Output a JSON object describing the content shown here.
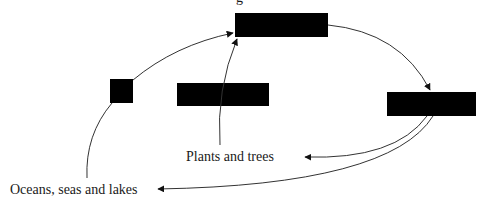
{
  "diagram": {
    "type": "water-cycle-flow",
    "top_label_fragment": "g",
    "boxes": [
      {
        "id": "top",
        "label": "",
        "redacted": true
      },
      {
        "id": "left-small",
        "label": "",
        "redacted": true
      },
      {
        "id": "middle",
        "label": "",
        "redacted": true
      },
      {
        "id": "right",
        "label": "",
        "redacted": true
      }
    ],
    "labels": {
      "plants": "Plants and trees",
      "oceans": "Oceans, seas and lakes"
    },
    "edges": [
      {
        "from": "left-small",
        "to": "top"
      },
      {
        "from": "plants",
        "to": "top"
      },
      {
        "from": "top",
        "to": "right"
      },
      {
        "from": "right",
        "to": "plants"
      },
      {
        "from": "right",
        "to": "oceans"
      },
      {
        "from": "oceans",
        "to": "left-small"
      }
    ],
    "colors": {
      "box": "#000000",
      "edge": "#333333",
      "text": "#1a1a1a",
      "background": "#ffffff"
    }
  }
}
